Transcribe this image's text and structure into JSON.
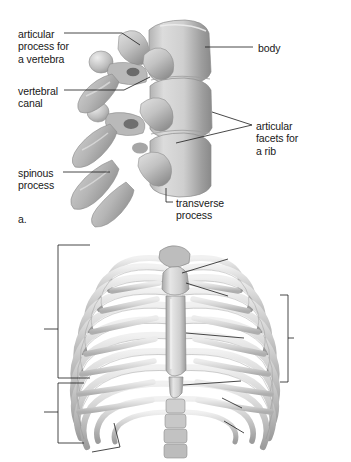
{
  "document": {
    "type": "anatomy-illustration",
    "background": "#ffffff",
    "ink": "#181818"
  },
  "figure_a": {
    "panel_letter": "a.",
    "subject": "thoracic-vertebrae-lateral-view",
    "labels": [
      {
        "id": "articular-process-for-a-vertebra",
        "lines": [
          "articular",
          "process for",
          "a vertebra"
        ],
        "x": 18,
        "y": 28,
        "align": "left"
      },
      {
        "id": "vertebral-canal",
        "lines": [
          "vertebral",
          "canal"
        ],
        "x": 18,
        "y": 85,
        "align": "left"
      },
      {
        "id": "spinous-process",
        "lines": [
          "spinous",
          "process"
        ],
        "x": 18,
        "y": 167,
        "align": "left"
      },
      {
        "id": "body",
        "lines": [
          "body"
        ],
        "x": 258,
        "y": 42,
        "align": "left"
      },
      {
        "id": "articular-facets-for-a-rib",
        "lines": [
          "articular",
          "facets for",
          "a rib"
        ],
        "x": 256,
        "y": 120,
        "align": "left"
      },
      {
        "id": "transverse-process",
        "lines": [
          "transverse",
          "process"
        ],
        "x": 176,
        "y": 197,
        "align": "left"
      }
    ]
  },
  "figure_b": {
    "panel_letter": "b.",
    "subject": "thoracic-cage-anterior-view",
    "rib_numbers": [
      {
        "n": "1",
        "x": 110,
        "y": 249
      },
      {
        "n": "2",
        "x": 98,
        "y": 264
      },
      {
        "n": "3",
        "x": 86,
        "y": 283
      },
      {
        "n": "4",
        "x": 79,
        "y": 303
      },
      {
        "n": "5",
        "x": 73,
        "y": 323
      },
      {
        "n": "6",
        "x": 70,
        "y": 345
      },
      {
        "n": "7",
        "x": 68,
        "y": 367
      },
      {
        "n": "8",
        "x": 68,
        "y": 391
      },
      {
        "n": "9",
        "x": 68,
        "y": 412
      },
      {
        "n": "10",
        "x": 64,
        "y": 431
      },
      {
        "n": "11",
        "x": 68,
        "y": 448
      },
      {
        "n": "12",
        "x": 116,
        "y": 430
      }
    ],
    "group_brackets": [
      {
        "id": "true-ribs",
        "label_lines": [
          "true",
          "ribs"
        ],
        "label_x": 13,
        "label_y": 316,
        "bracket_x": 58,
        "bracket_top": 245,
        "bracket_bottom": 378,
        "tick_y": 329
      },
      {
        "id": "false-ribs",
        "label_lines": [
          "false",
          "ribs"
        ],
        "label_x": 13,
        "label_y": 399,
        "bracket_x": 58,
        "bracket_top": 383,
        "bracket_bottom": 443,
        "tick_y": 412
      }
    ],
    "labels": [
      {
        "id": "thoracic-vertebra",
        "lines": [
          "thoracic vertebra"
        ],
        "x": 232,
        "y": 254,
        "align": "left"
      },
      {
        "id": "manubrium",
        "lines": [
          "manubrium"
        ],
        "x": 232,
        "y": 290,
        "align": "left"
      },
      {
        "id": "body",
        "lines": [
          "body"
        ],
        "x": 248,
        "y": 332,
        "align": "left"
      },
      {
        "id": "xiphoid-process",
        "lines": [
          "xiphoid",
          "process"
        ],
        "x": 245,
        "y": 374,
        "align": "left"
      },
      {
        "id": "ribs",
        "lines": [
          "ribs"
        ],
        "x": 246,
        "y": 402,
        "align": "left"
      },
      {
        "id": "costal-cartilage",
        "lines": [
          "costal cartilage"
        ],
        "x": 248,
        "y": 427,
        "align": "left"
      },
      {
        "id": "floating-ribs",
        "lines": [
          "floating ribs"
        ],
        "x": 124,
        "y": 447,
        "align": "left"
      },
      {
        "id": "sternum",
        "lines": [
          "sternum"
        ],
        "x": 297,
        "y": 332,
        "align": "left"
      }
    ],
    "sternum_bracket": {
      "x": 288,
      "top": 295,
      "bottom": 382,
      "tick_y": 338
    }
  },
  "palette": {
    "bone_light": "#e9e9e9",
    "bone_mid": "#c6c6c6",
    "bone_dark": "#9a9a9a",
    "bone_shadow": "#7b7b7b",
    "leader_line": "#1a1a1a"
  }
}
